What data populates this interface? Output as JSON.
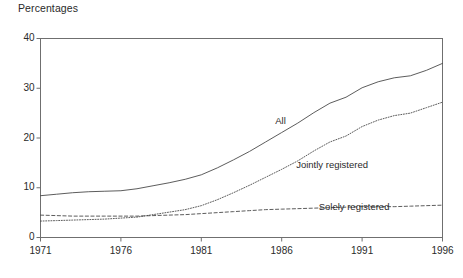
{
  "chart_data": {
    "type": "line",
    "title": "Percentages",
    "xlabel": "",
    "ylabel": "",
    "xlim": [
      1971,
      1996
    ],
    "ylim": [
      0,
      40
    ],
    "grid": false,
    "legend_position": "inline-annotations",
    "x_ticks": [
      "1971",
      "1976",
      "1981",
      "1986",
      "1991",
      "1996"
    ],
    "y_ticks": [
      "0",
      "10",
      "20",
      "30",
      "40"
    ],
    "x": [
      1971,
      1972,
      1973,
      1974,
      1975,
      1976,
      1977,
      1978,
      1979,
      1980,
      1981,
      1982,
      1983,
      1984,
      1985,
      1986,
      1987,
      1988,
      1989,
      1990,
      1991,
      1992,
      1993,
      1994,
      1995,
      1996
    ],
    "series": [
      {
        "name": "All",
        "style": "solid",
        "label": "All",
        "values": [
          8.4,
          8.7,
          9.0,
          9.2,
          9.3,
          9.4,
          9.8,
          10.4,
          11.0,
          11.7,
          12.6,
          14.0,
          15.6,
          17.3,
          19.2,
          21.1,
          23.0,
          25.1,
          27.0,
          28.2,
          30.1,
          31.3,
          32.1,
          32.5,
          33.6,
          35.0
        ]
      },
      {
        "name": "Jointly registered",
        "style": "dotted",
        "label": "Jointly registered",
        "values": [
          3.3,
          3.4,
          3.5,
          3.6,
          3.7,
          3.9,
          4.1,
          4.6,
          5.1,
          5.6,
          6.4,
          7.6,
          9.0,
          10.5,
          12.1,
          13.7,
          15.4,
          17.4,
          19.2,
          20.4,
          22.3,
          23.6,
          24.5,
          25.0,
          26.1,
          27.2
        ]
      },
      {
        "name": "Solely registered",
        "style": "dashed",
        "label": "Solely registered",
        "values": [
          4.5,
          4.4,
          4.3,
          4.3,
          4.3,
          4.3,
          4.3,
          4.4,
          4.5,
          4.6,
          4.8,
          5.0,
          5.2,
          5.4,
          5.6,
          5.7,
          5.8,
          5.9,
          6.0,
          6.1,
          6.2,
          6.2,
          6.2,
          6.3,
          6.4,
          6.5
        ]
      }
    ],
    "annotations": [
      {
        "text": "All",
        "x": 1985.6,
        "y": 23.4
      },
      {
        "text": "Jointly registered",
        "x": 1986.9,
        "y": 14.5
      },
      {
        "text": "Solely registered",
        "x": 1988.3,
        "y": 6.2
      }
    ]
  }
}
